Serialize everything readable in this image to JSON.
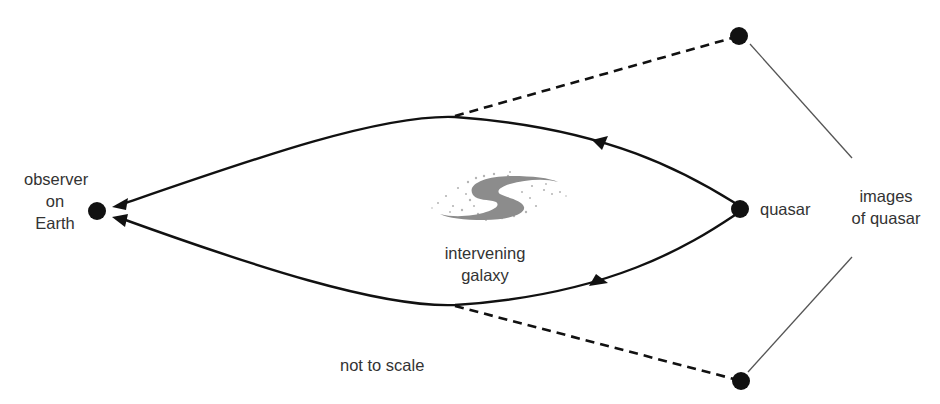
{
  "diagram": {
    "type": "gravitational-lensing",
    "labels": {
      "observer": [
        "observer",
        "on",
        "Earth"
      ],
      "quasar": "quasar",
      "images": [
        "images",
        "of quasar"
      ],
      "galaxy": [
        "intervening",
        "galaxy"
      ],
      "note": "not to scale"
    },
    "nodes": [
      {
        "id": "observer",
        "x": 97,
        "y": 211
      },
      {
        "id": "quasar",
        "x": 740,
        "y": 209
      },
      {
        "id": "image-top",
        "x": 739,
        "y": 36
      },
      {
        "id": "image-bottom",
        "x": 741,
        "y": 381
      }
    ],
    "colors": {
      "line": "#111111",
      "text": "#333333",
      "galaxy": "#8c8c8c",
      "leader": "#555555"
    }
  }
}
